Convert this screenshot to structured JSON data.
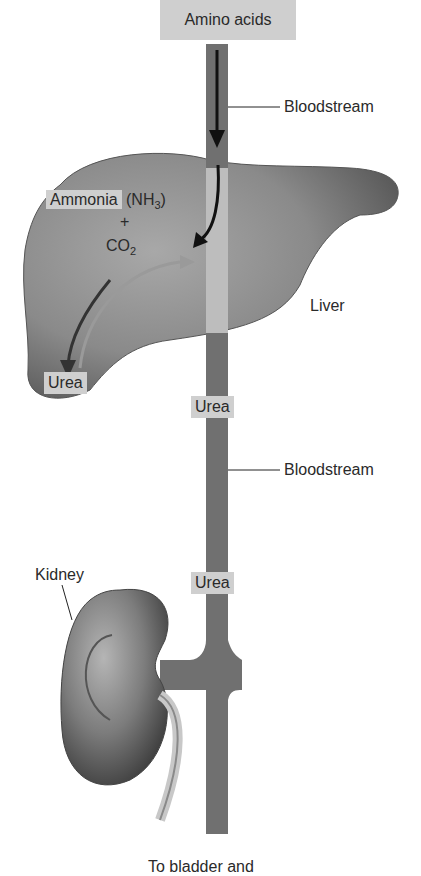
{
  "diagram": {
    "title_box": "Amino acids",
    "labels": {
      "bloodstream_top": "Bloodstream",
      "bloodstream_mid": "Bloodstream",
      "ammonia": "Ammonia",
      "nh3_prefix": "(NH",
      "nh3_sub": "3",
      "nh3_suffix": ")",
      "plus": "+",
      "co2_prefix": "CO",
      "co2_sub": "2",
      "liver": "Liver",
      "urea_liver": "Urea",
      "urea_blood_1": "Urea",
      "urea_blood_2": "Urea",
      "kidney": "Kidney",
      "bottom_caption_partial": "To bladder and"
    },
    "colors": {
      "organ": "#7a7a7a",
      "bloodstream": "#707070",
      "label_box": "#cfcfcf",
      "arrow": "#111111",
      "urea_arrow": "#555555"
    }
  }
}
